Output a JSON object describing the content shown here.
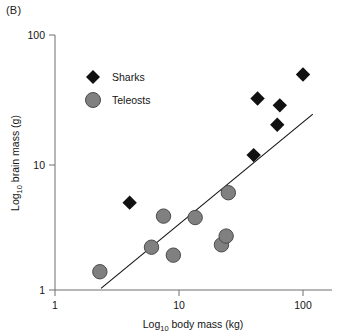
{
  "panel": {
    "label": "(B)"
  },
  "chart_data": {
    "type": "scatter",
    "title": "",
    "xlabel": "Log10 body mass (kg)",
    "xlabel_base": "Log",
    "xlabel_sub": "10",
    "xlabel_rest": " body mass (kg)",
    "ylabel": "Log10 brain mass (g)",
    "ylabel_base": "Log",
    "ylabel_sub": "10",
    "ylabel_rest": " brain mass (g)",
    "xscale": "log",
    "yscale": "log",
    "xlim": [
      1,
      130
    ],
    "ylim": [
      1,
      100
    ],
    "xticks": [
      1,
      10,
      100
    ],
    "xtick_labels": [
      "1",
      "10",
      "100"
    ],
    "yticks": [
      1,
      10,
      100
    ],
    "ytick_labels": [
      "1",
      "10",
      "100"
    ],
    "grid": false,
    "legend_position": "upper-left-inside",
    "series": [
      {
        "name": "Sharks",
        "marker": "diamond",
        "color": "#111111",
        "points": [
          {
            "x": 4.0,
            "y": 5.0
          },
          {
            "x": 40.0,
            "y": 12.0
          },
          {
            "x": 43.0,
            "y": 34.0
          },
          {
            "x": 62.0,
            "y": 21.0
          },
          {
            "x": 65.0,
            "y": 30.0
          },
          {
            "x": 100.0,
            "y": 53.0
          }
        ]
      },
      {
        "name": "Teleosts",
        "marker": "circle",
        "color": "#808080",
        "points": [
          {
            "x": 2.3,
            "y": 1.4
          },
          {
            "x": 6.0,
            "y": 2.2
          },
          {
            "x": 7.5,
            "y": 3.9
          },
          {
            "x": 9.0,
            "y": 1.9
          },
          {
            "x": 13.5,
            "y": 3.8
          },
          {
            "x": 22.0,
            "y": 2.3
          },
          {
            "x": 24.0,
            "y": 2.7
          },
          {
            "x": 25.0,
            "y": 6.0
          }
        ]
      }
    ],
    "trendline": {
      "name": "regression-line",
      "color": "#111111",
      "start": {
        "x": 2.35,
        "y": 1.03
      },
      "end": {
        "x": 120.0,
        "y": 25.5
      }
    },
    "legend": [
      {
        "label": "Sharks",
        "marker": "diamond",
        "color": "#111111"
      },
      {
        "label": "Teleosts",
        "marker": "circle",
        "color": "#808080"
      }
    ]
  }
}
